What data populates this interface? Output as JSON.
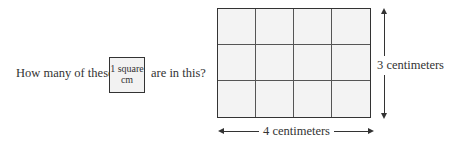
{
  "question": {
    "before": "How many of these",
    "unit_label_line1": "1 square",
    "unit_label_line2": "cm",
    "after": "are in this?"
  },
  "rectangle": {
    "columns": 4,
    "rows": 3,
    "width_label": "4 centimeters",
    "height_label": "3 centimeters"
  },
  "colors": {
    "fill": "#f3f3f3",
    "stroke": "#333333"
  }
}
